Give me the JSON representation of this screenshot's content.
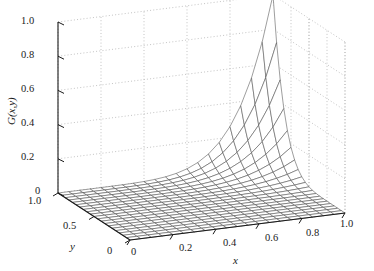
{
  "figure": {
    "type": "surface-3d-mesh",
    "background_color": "#ffffff",
    "mesh_color": "#4d4d4d",
    "axis_color": "#1a1a1a",
    "grid_color": "#b4b4b4",
    "grid_style": "dotted"
  },
  "axes": {
    "z": {
      "label": "G(x,y)",
      "ticks": [
        "1.0",
        "0.8",
        "0.6",
        "0.4",
        "0.2",
        "0"
      ],
      "tick_values": [
        1.0,
        0.8,
        0.6,
        0.4,
        0.2,
        0.0
      ],
      "range": [
        0,
        1
      ]
    },
    "y": {
      "label": "y",
      "ticks": [
        "1.0",
        "0.5",
        "0"
      ],
      "tick_values": [
        1.0,
        0.5,
        0.0
      ],
      "range": [
        0,
        1
      ]
    },
    "x": {
      "label": "x",
      "ticks": [
        "0",
        "0.2",
        "0.4",
        "0.6",
        "0.8",
        "1.0"
      ],
      "tick_values": [
        0.0,
        0.2,
        0.4,
        0.6,
        0.8,
        1.0
      ],
      "range": [
        0,
        1
      ]
    }
  },
  "chart_data": {
    "type": "surface",
    "title": "",
    "xlabel": "x",
    "ylabel": "y",
    "zlabel": "G(x,y)",
    "xlim": [
      0,
      1
    ],
    "ylim": [
      0,
      1
    ],
    "zlim": [
      0,
      1
    ],
    "grid": true,
    "legend": "none",
    "view": {
      "azimuth": -37.5,
      "elevation": 30
    },
    "mesh": {
      "nx": 20,
      "ny": 20
    },
    "x": [
      0,
      0.05,
      0.1,
      0.15,
      0.2,
      0.25,
      0.3,
      0.35,
      0.4,
      0.45,
      0.5,
      0.55,
      0.6,
      0.65,
      0.7,
      0.75,
      0.8,
      0.85,
      0.9,
      0.95,
      1.0
    ],
    "y": [
      0,
      0.05,
      0.1,
      0.15,
      0.2,
      0.25,
      0.3,
      0.35,
      0.4,
      0.45,
      0.5,
      0.55,
      0.6,
      0.65,
      0.7,
      0.75,
      0.8,
      0.85,
      0.9,
      0.95,
      1.0
    ],
    "z_formula": "G(x,y) = (x*y)^6",
    "z_corner_values": {
      "x0_y0": 0.0,
      "x1_y0": 0.0,
      "x0_y1": 0.0,
      "x1_y1": 1.0
    }
  }
}
